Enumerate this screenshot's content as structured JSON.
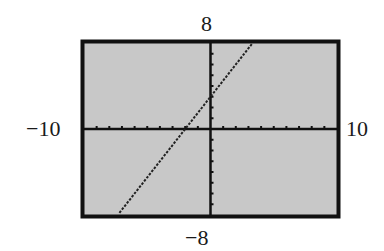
{
  "chart_data": {
    "type": "line",
    "title": "",
    "xlabel": "",
    "ylabel": "",
    "xlim": [
      -10,
      10
    ],
    "ylim": [
      -8,
      8
    ],
    "x_tick_step": 1,
    "y_tick_step": 1,
    "grid": false,
    "legend": null,
    "window_labels": {
      "xmin": "−10",
      "xmax": "10",
      "ymin": "−8",
      "ymax": "8"
    },
    "series": [
      {
        "name": "y = 1.5x + 3",
        "style": "dotted",
        "x": [
          -7.2,
          -2,
          0,
          3.33
        ],
        "y": [
          -7.8,
          0,
          3,
          8
        ]
      }
    ]
  },
  "colors": {
    "screen_background": "#c8c8c8",
    "frame": "#111111",
    "axes": "#111111",
    "line": "#222222",
    "page": "#ffffff"
  }
}
